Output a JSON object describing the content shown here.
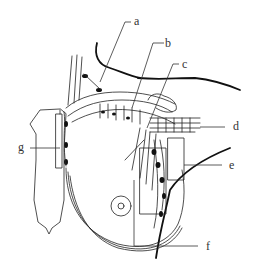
{
  "diagram": {
    "type": "anatomical-line-drawing",
    "colors": {
      "line": "#222222",
      "label": "#333333",
      "background": "#ffffff"
    },
    "labels": [
      {
        "id": "a",
        "text": "a"
      },
      {
        "id": "b",
        "text": "b"
      },
      {
        "id": "c",
        "text": "c"
      },
      {
        "id": "d",
        "text": "d"
      },
      {
        "id": "e",
        "text": "e"
      },
      {
        "id": "f",
        "text": "f"
      },
      {
        "id": "g",
        "text": "g"
      }
    ]
  }
}
